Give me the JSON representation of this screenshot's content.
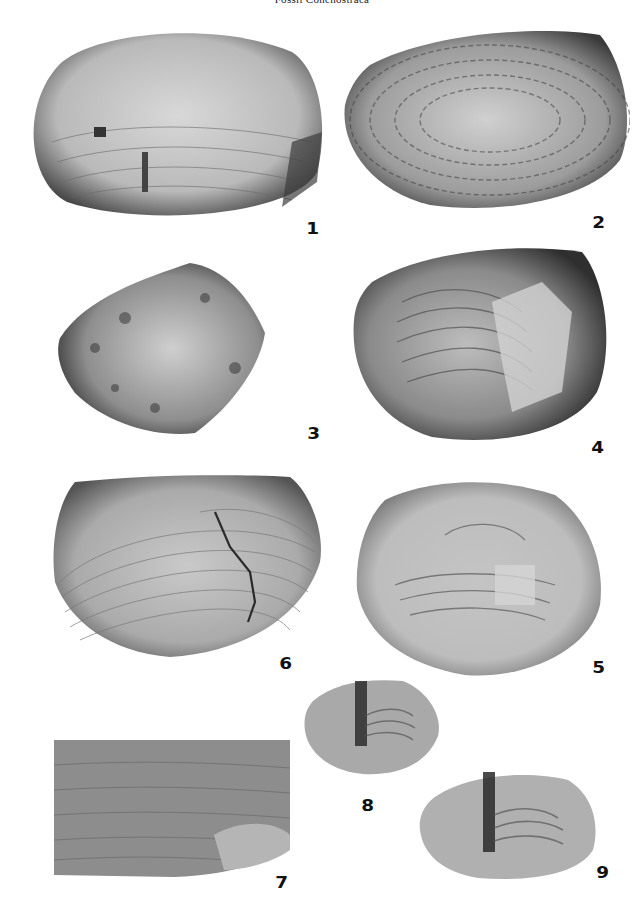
{
  "page": {
    "header": "Fossil Conchostraca",
    "background": "#ffffff"
  },
  "plate": {
    "description": "Plate of photographed fossil conchostracan carapaces (grayscale), nine numbered figures",
    "figures": [
      {
        "number": "1",
        "shape": "elongate oval carapace, concentric growth lines, rough surface"
      },
      {
        "number": "2",
        "shape": "oval carapace, coarse granular texture with concentric bands"
      },
      {
        "number": "3",
        "shape": "sub-rhomboid carapace, rough granular surface"
      },
      {
        "number": "4",
        "shape": "sub-rounded carapace, concentric growth lines with flaked shell"
      },
      {
        "number": "5",
        "shape": "rounded carapace, partially broken shell with growth bands"
      },
      {
        "number": "6",
        "shape": "sub-rectangular oval carapace, fine concentric growth lines, crack"
      },
      {
        "number": "7",
        "shape": "enlarged rectangular detail of growth bands"
      },
      {
        "number": "8",
        "shape": "small carapace with dark umbonal ridge"
      },
      {
        "number": "9",
        "shape": "small oval carapace with dark umbonal ridge"
      }
    ]
  }
}
